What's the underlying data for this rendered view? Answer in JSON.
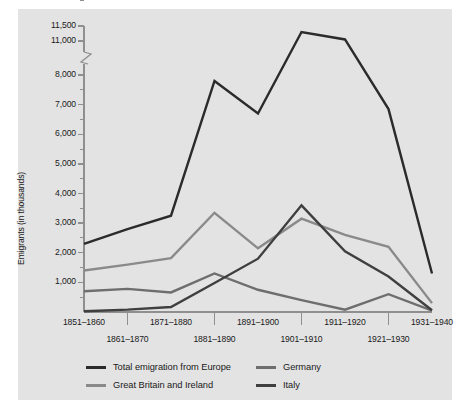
{
  "chart_data": {
    "type": "line",
    "title": "",
    "xlabel": "",
    "ylabel": "Emigrants (in thousands)",
    "grid": false,
    "legend_position": "bottom",
    "axis_break": {
      "below": 8000,
      "above": 11000,
      "note": "y-axis has a break between 8,000 and 11,000"
    },
    "ylim": [
      0,
      11500
    ],
    "ytick_labels": [
      "11,500",
      "11,000",
      "8,000",
      "7,000",
      "6,000",
      "5,000",
      "4,000",
      "3,000",
      "2,000",
      "1,000"
    ],
    "yticks": [
      11500,
      11000,
      8000,
      7000,
      6000,
      5000,
      4000,
      3000,
      2000,
      1000
    ],
    "minor_yticks": [
      10500,
      7500,
      6500,
      5500,
      4500,
      3500,
      2500,
      1500,
      500
    ],
    "categories": [
      "1851–1860",
      "1861–1870",
      "1871–1880",
      "1881–1890",
      "1891–1900",
      "1901–1910",
      "1911–1920",
      "1921–1930",
      "1931–1940"
    ],
    "series": [
      {
        "name": "Total emigration from Europe",
        "color": "#2b2b2b",
        "values": [
          2300,
          2800,
          3250,
          7800,
          6700,
          11300,
          9200,
          6850,
          1300
        ]
      },
      {
        "name": "Great Britain and Ireland",
        "color": "#8a8a8a",
        "values": [
          1400,
          1600,
          1820,
          3350,
          2150,
          3150,
          2600,
          2200,
          300
        ]
      },
      {
        "name": "Germany",
        "color": "#6e6e6e",
        "values": [
          700,
          780,
          660,
          1300,
          750,
          400,
          80,
          600,
          50
        ]
      },
      {
        "name": "Italy",
        "color": "#3f3f3f",
        "values": [
          25,
          80,
          170,
          980,
          1800,
          3600,
          2050,
          1200,
          60
        ]
      }
    ]
  },
  "axis": {
    "ylabel": "Emigrants (in thousands)",
    "yticks": [
      {
        "label": "11,500"
      },
      {
        "label": "11,000"
      },
      {
        "label": "8,000"
      },
      {
        "label": "7,000"
      },
      {
        "label": "6,000"
      },
      {
        "label": "5,000"
      },
      {
        "label": "4,000"
      },
      {
        "label": "3,000"
      },
      {
        "label": "2,000"
      },
      {
        "label": "1,000"
      }
    ],
    "xticks": [
      {
        "label": "1851–1860"
      },
      {
        "label": "1861–1870"
      },
      {
        "label": "1871–1880"
      },
      {
        "label": "1881–1890"
      },
      {
        "label": "1891–1900"
      },
      {
        "label": "1901–1910"
      },
      {
        "label": "1911–1920"
      },
      {
        "label": "1921–1930"
      },
      {
        "label": "1931–1940"
      }
    ]
  },
  "legend": {
    "entries": [
      {
        "label": "Total emigration from Europe",
        "color": "#2b2b2b"
      },
      {
        "label": "Great Britain and Ireland",
        "color": "#8a8a8a"
      },
      {
        "label": "Germany",
        "color": "#6e6e6e"
      },
      {
        "label": "Italy",
        "color": "#3f3f3f"
      }
    ]
  },
  "colors": {
    "background": "#ffffff",
    "panel": "#e3e3e3",
    "axis": "#8f8f8f",
    "text": "#1a1a1a"
  }
}
